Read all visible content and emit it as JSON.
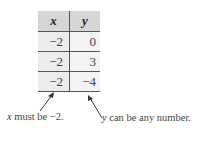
{
  "table": {
    "headers": [
      "x",
      "y"
    ],
    "rows": [
      {
        "x": "−2",
        "y": "0"
      },
      {
        "x": "−2",
        "y": "3"
      },
      {
        "x": "−2",
        "y": "−4"
      }
    ]
  },
  "annotations": {
    "left": {
      "var": "x",
      "text": " must be −2."
    },
    "right": {
      "var": "y",
      "text": " can be any number."
    }
  }
}
